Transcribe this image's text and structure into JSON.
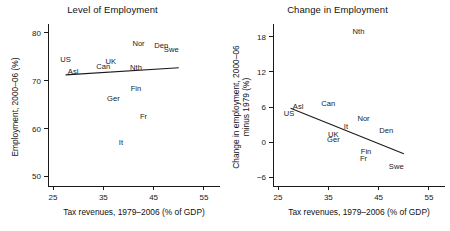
{
  "figure": {
    "background_color": "#ffffff",
    "ink_color": "#1a1a1a"
  },
  "panels": [
    {
      "key": "level",
      "title": "Level of Employment",
      "xlabel": "Tax revenues, 1979–2006 (% of GDP)",
      "ylabel": "Employment, 2000–06 (%)",
      "ylabel_line2": ""
    },
    {
      "key": "change",
      "title": "Change in Employment",
      "xlabel": "Tax revenues, 1979–2006 (% of GDP)",
      "ylabel": "Change in employment, 2000–06",
      "ylabel_line2": "minus 1979 (%)"
    }
  ],
  "chart_data": [
    {
      "type": "scatter",
      "title": "Level of Employment",
      "xlabel": "Tax revenues, 1979–2006 (% of GDP)",
      "ylabel": "Employment, 2000–06 (%)",
      "xlim": [
        24,
        57
      ],
      "ylim": [
        48,
        81
      ],
      "xticks": [
        25,
        35,
        45,
        55
      ],
      "yticks": [
        50,
        60,
        70,
        80
      ],
      "grid": false,
      "legend": "none",
      "labels_as_markers": true,
      "points": [
        {
          "label": "US",
          "x": 27.5,
          "y": 74.0
        },
        {
          "label": "Asl",
          "x": 29.0,
          "y": 71.3
        },
        {
          "label": "Can",
          "x": 35.0,
          "y": 72.4
        },
        {
          "label": "UK",
          "x": 36.5,
          "y": 73.4
        },
        {
          "label": "Nth",
          "x": 41.5,
          "y": 72.2
        },
        {
          "label": "Nor",
          "x": 42.0,
          "y": 77.2
        },
        {
          "label": "Den",
          "x": 46.5,
          "y": 76.8
        },
        {
          "label": "Swe",
          "x": 48.5,
          "y": 75.9
        },
        {
          "label": "Ger",
          "x": 37.0,
          "y": 65.8
        },
        {
          "label": "Fin",
          "x": 41.5,
          "y": 67.9
        },
        {
          "label": "Fr",
          "x": 43.0,
          "y": 62.0
        },
        {
          "label": "It",
          "x": 38.5,
          "y": 56.6
        }
      ],
      "trend_line": {
        "x1": 27.5,
        "y1": 71.2,
        "x2": 50.0,
        "y2": 72.7
      }
    },
    {
      "type": "scatter",
      "title": "Change in Employment",
      "xlabel": "Tax revenues, 1979–2006 (% of GDP)",
      "ylabel": "Change in employment, 2000–06 minus 1979 (%)",
      "xlim": [
        24,
        57
      ],
      "ylim": [
        -7.5,
        19.5
      ],
      "xticks": [
        25,
        35,
        45,
        55
      ],
      "yticks": [
        -6,
        0,
        6,
        12,
        18
      ],
      "grid": false,
      "legend": "none",
      "labels_as_markers": true,
      "points": [
        {
          "label": "Nth",
          "x": 41.0,
          "y": 18.4
        },
        {
          "label": "Asl",
          "x": 29.0,
          "y": 5.7
        },
        {
          "label": "Can",
          "x": 35.0,
          "y": 6.1
        },
        {
          "label": "US",
          "x": 27.2,
          "y": 4.5
        },
        {
          "label": "Nor",
          "x": 42.0,
          "y": 3.6
        },
        {
          "label": "It",
          "x": 38.5,
          "y": 2.2
        },
        {
          "label": "Den",
          "x": 46.5,
          "y": 1.6
        },
        {
          "label": "UK",
          "x": 36.0,
          "y": 0.8
        },
        {
          "label": "Ger",
          "x": 36.0,
          "y": 0.0
        },
        {
          "label": "Fin",
          "x": 42.5,
          "y": -2.1
        },
        {
          "label": "Fr",
          "x": 42.0,
          "y": -3.2
        },
        {
          "label": "Swe",
          "x": 48.5,
          "y": -4.6
        }
      ],
      "trend_line": {
        "x1": 27.5,
        "y1": 5.8,
        "x2": 50.0,
        "y2": -2.0
      }
    }
  ]
}
